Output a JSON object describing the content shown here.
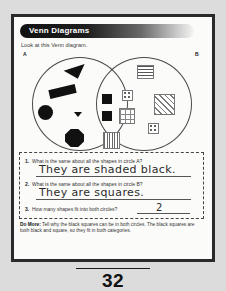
{
  "worksheet": {
    "title": "Venn Diagrams",
    "instruction": "Look at this Venn diagram.",
    "page_number": "32"
  },
  "venn": {
    "label_a": "A",
    "label_b": "B",
    "circle_a_shapes": [
      {
        "name": "black-triangle-large",
        "fill": "solid-black",
        "shape": "triangle"
      },
      {
        "name": "black-rectangle",
        "fill": "solid-black",
        "shape": "rectangle"
      },
      {
        "name": "black-circle",
        "fill": "solid-black",
        "shape": "circle"
      },
      {
        "name": "black-triangle-small",
        "fill": "solid-black",
        "shape": "triangle"
      },
      {
        "name": "black-octagon",
        "fill": "solid-black",
        "shape": "octagon"
      }
    ],
    "intersection_shapes": [
      {
        "name": "black-square-1",
        "fill": "solid-black",
        "shape": "square"
      },
      {
        "name": "black-square-2",
        "fill": "solid-black",
        "shape": "square"
      }
    ],
    "circle_b_shapes": [
      {
        "name": "horizontal-striped-square",
        "fill": "horizontal-stripes",
        "shape": "square"
      },
      {
        "name": "dotted-square-small-1",
        "fill": "dots",
        "shape": "square"
      },
      {
        "name": "diagonal-hatched-square",
        "fill": "diagonal-lines",
        "shape": "square"
      },
      {
        "name": "grid-square",
        "fill": "grid",
        "shape": "square"
      },
      {
        "name": "dotted-square-small-2",
        "fill": "dots",
        "shape": "square"
      },
      {
        "name": "vertical-striped-square",
        "fill": "vertical-stripes",
        "shape": "square"
      }
    ]
  },
  "questions": [
    {
      "number": "1.",
      "text": "What is the same about all the shapes in circle A?",
      "answer": "They are shaded black."
    },
    {
      "number": "2.",
      "text": "What is the same about all the shapes in circle B?",
      "answer": "They are squares."
    },
    {
      "number": "3.",
      "text": "How many shapes fit into both circles?",
      "answer": "2"
    }
  ],
  "do_more": {
    "label": "Do More:",
    "prompt": "Tell why the black squares can be in both circles.",
    "response": "The black squares are both black and square, so they fit in both categories."
  }
}
